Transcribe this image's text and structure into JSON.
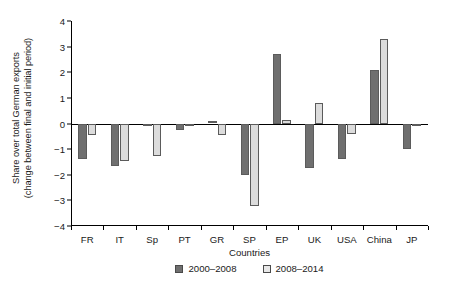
{
  "chart_data": {
    "type": "bar",
    "title": "",
    "xlabel": "Countries",
    "ylabel": "Share over total German exports (change between final and initial period)",
    "ylabel_line1": "Share over total German exports",
    "ylabel_line2": "(change between final and initial period)",
    "categories": [
      "FR",
      "IT",
      "Sp",
      "PT",
      "GR",
      "SP",
      "EP",
      "UK",
      "USA",
      "China",
      "JP"
    ],
    "series": [
      {
        "name": "2000–2008",
        "color": "#6f6f6f",
        "values": [
          -1.4,
          -1.65,
          -0.1,
          -0.25,
          0.08,
          -2.0,
          2.7,
          -1.75,
          -1.4,
          2.1,
          -1.0
        ]
      },
      {
        "name": "2008–2014",
        "color": "#dcdcdc",
        "values": [
          -0.45,
          -1.45,
          -1.25,
          -0.05,
          -0.45,
          -3.2,
          0.15,
          0.8,
          -0.4,
          3.3,
          -0.1
        ]
      }
    ],
    "ylim": [
      -4,
      4
    ],
    "yticks": [
      4,
      3,
      2,
      1,
      0,
      -1,
      -2,
      -3,
      -4
    ],
    "ytick_labels": [
      "4",
      "3",
      "2",
      "1",
      "0",
      "−1",
      "−2",
      "−3",
      "−4"
    ],
    "grid": false,
    "legend_position": "bottom-center",
    "zero_line": true,
    "annotations": []
  },
  "legend": {
    "items": [
      {
        "label": "2000–2008",
        "style": "dark"
      },
      {
        "label": "2008–2014",
        "style": "light"
      }
    ]
  }
}
